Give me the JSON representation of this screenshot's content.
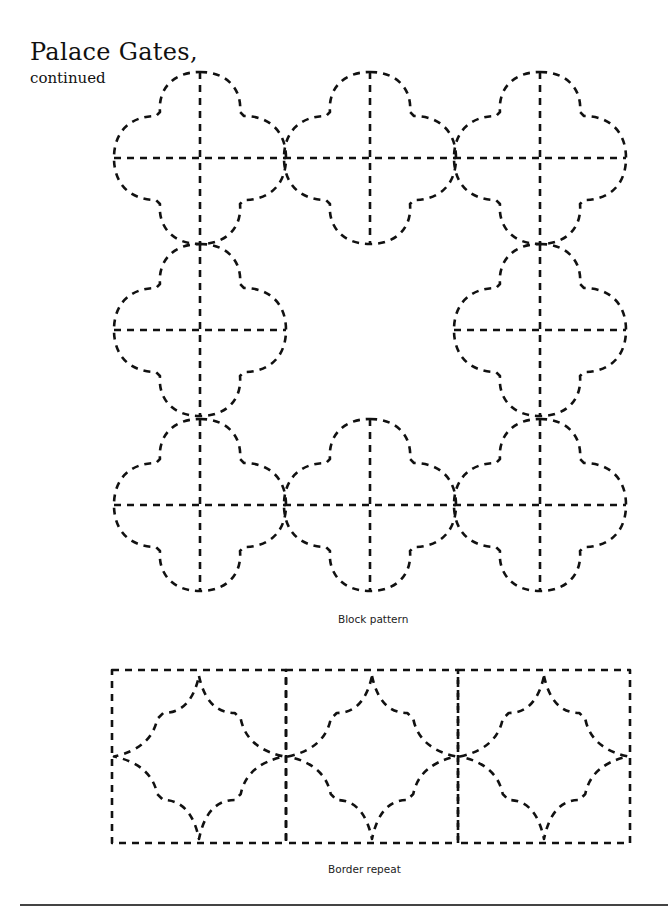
{
  "page": {
    "title": "Palace Gates,",
    "subtitle": "continued"
  },
  "figures": {
    "block_pattern": {
      "caption": "Block pattern",
      "grid": "3x3 with empty center",
      "motif": "quatrefoil with dashed cross",
      "cells": [
        {
          "row": 0,
          "col": 0,
          "cx": 200,
          "cy": 158
        },
        {
          "row": 0,
          "col": 1,
          "cx": 370,
          "cy": 158
        },
        {
          "row": 0,
          "col": 2,
          "cx": 540,
          "cy": 158
        },
        {
          "row": 1,
          "col": 0,
          "cx": 200,
          "cy": 330
        },
        {
          "row": 1,
          "col": 2,
          "cx": 540,
          "cy": 330
        },
        {
          "row": 2,
          "col": 0,
          "cx": 200,
          "cy": 505
        },
        {
          "row": 2,
          "col": 1,
          "cx": 370,
          "cy": 505
        },
        {
          "row": 2,
          "col": 2,
          "cx": 540,
          "cy": 505
        }
      ]
    },
    "border_repeat": {
      "caption": "Border repeat",
      "motif": "four-pointed concave star in square",
      "squares": [
        {
          "x": 112,
          "y": 670,
          "w": 174,
          "h": 173
        },
        {
          "x": 286,
          "y": 670,
          "w": 172,
          "h": 173
        },
        {
          "x": 458,
          "y": 670,
          "w": 172,
          "h": 173
        }
      ]
    }
  },
  "colors": {
    "ink": "#111111",
    "background": "#ffffff",
    "rule": "#444444"
  }
}
